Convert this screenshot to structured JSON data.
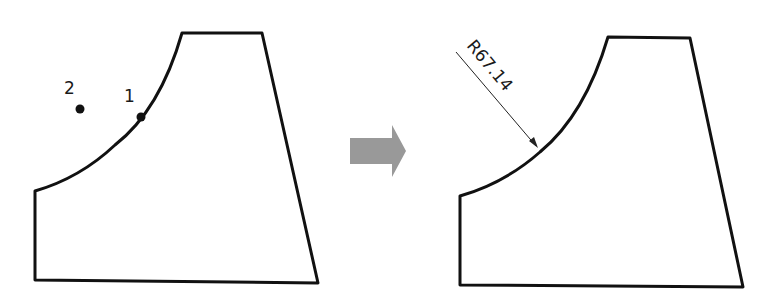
{
  "diagram": {
    "before": {
      "point_labels": [
        "2",
        "1"
      ],
      "points": [
        {
          "label": "2",
          "x": 80,
          "y": 109
        },
        {
          "label": "1",
          "x": 141,
          "y": 117
        }
      ]
    },
    "transition": {
      "icon": "right-arrow-icon",
      "color": "#999999"
    },
    "after": {
      "dimension_text": "R67.14"
    },
    "colors": {
      "outline": "#111111",
      "arrow": "#999999"
    }
  }
}
